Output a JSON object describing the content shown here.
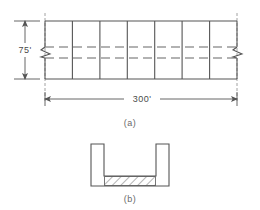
{
  "drawing": {
    "title": "Structural elevation and channel cross-section",
    "stroke_color": "#555555",
    "thin_stroke_color": "#888888",
    "hatch_color": "#666666",
    "background": "#ffffff"
  },
  "figure_a": {
    "caption": "(a)",
    "height_dimension": {
      "label": "75'",
      "value": 75,
      "unit": "ft"
    },
    "span_dimension": {
      "label": "300'",
      "value": 300,
      "unit": "ft"
    },
    "bays": 7,
    "stories": 2,
    "break_symbols": [
      "left",
      "right"
    ],
    "mid_lines_style": "dashed"
  },
  "figure_b": {
    "caption": "(b)",
    "shape": "channel-section",
    "fill_pattern": "diagonal-hatch",
    "fill_label": "hatched-base"
  }
}
